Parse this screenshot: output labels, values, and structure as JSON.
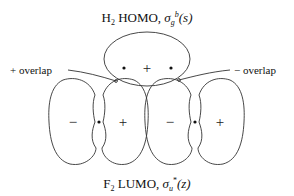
{
  "top_title": {
    "prefix": "H",
    "subscript": "2",
    "middle": " HOMO, ",
    "sigma": "σ",
    "sigma_sub": "g",
    "sigma_sup": "b",
    "arg": "(s)",
    "full_text": "H2 HOMO, σg^b(s)"
  },
  "bottom_title": {
    "prefix": "F",
    "subscript": "2",
    "middle": " LUMO, ",
    "sigma": "σ",
    "sigma_sub": "u",
    "sigma_sup": "*",
    "arg": "(z)",
    "full_text": "F2 LUMO, σu*(z)"
  },
  "labels": {
    "plus_overlap": "+ overlap",
    "minus_overlap": "− overlap"
  },
  "h2_orbital": {
    "sign": "+",
    "nuclei": 2
  },
  "f2_lobes": [
    {
      "sign": "−"
    },
    {
      "sign": "+"
    },
    {
      "sign": "−"
    },
    {
      "sign": "+"
    }
  ],
  "colors": {
    "line": "#333333",
    "text": "#111111",
    "background": "#ffffff"
  }
}
